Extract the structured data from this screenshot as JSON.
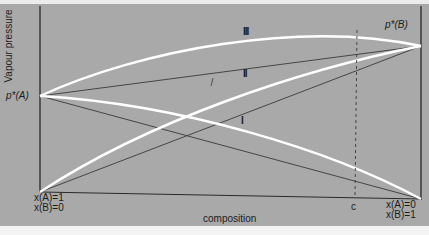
{
  "diagram": {
    "y_axis_label": "Vapour pressure",
    "x_axis_label": "composition",
    "left_point_label": "p*(A)",
    "right_point_label": "p*(B)",
    "left_composition": [
      "x(A)=1",
      "x(B)=0"
    ],
    "right_composition": [
      "x(A)=0",
      "x(B)=1"
    ],
    "marker_label": "c",
    "curve_labels": [
      "I",
      "II",
      "III"
    ],
    "colors": {
      "background": "#a9a9a9",
      "curves": "#ffffff",
      "lines": "#3a3a3a"
    }
  }
}
